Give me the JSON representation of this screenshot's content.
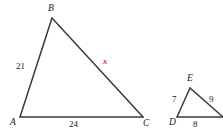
{
  "figure": {
    "type": "similar-triangles-geometry-diagram",
    "background_color": "#ffffff",
    "stroke_color": "#3a3a3a",
    "text_color": "#1a1a1a",
    "unknown_color": "#d6333f",
    "large_triangle": {
      "name": "ABC",
      "vertices": [
        {
          "key": "A",
          "label": "A",
          "x": 20,
          "y": 117
        },
        {
          "key": "B",
          "label": "B",
          "x": 52,
          "y": 18
        },
        {
          "key": "C",
          "label": "C",
          "x": 143,
          "y": 117
        }
      ],
      "sides": [
        {
          "key": "AB",
          "label": "21",
          "value": 21,
          "label_x": 16,
          "label_y": 62
        },
        {
          "key": "BC",
          "label": "x",
          "value": null,
          "is_unknown": true,
          "label_x": 103,
          "label_y": 57
        },
        {
          "key": "AC",
          "label": "24",
          "value": 24,
          "label_x": 69,
          "label_y": 120
        }
      ]
    },
    "small_triangle": {
      "name": "DEF",
      "vertices": [
        {
          "key": "D",
          "label": "D",
          "x": 177,
          "y": 117
        },
        {
          "key": "E",
          "label": "E",
          "x": 190,
          "y": 88
        },
        {
          "key": "F",
          "label": "",
          "x": 222,
          "y": 117
        }
      ],
      "sides": [
        {
          "key": "DE",
          "label": "7",
          "value": 7,
          "label_x": 172,
          "label_y": 95
        },
        {
          "key": "EF",
          "label": "9",
          "value": 9,
          "label_x": 209,
          "label_y": 95
        },
        {
          "key": "DF",
          "label": "8",
          "value": 8,
          "label_x": 193,
          "label_y": 120
        }
      ]
    },
    "vertex_labels": {
      "A": "A",
      "B": "B",
      "C": "C",
      "D": "D",
      "E": "E"
    },
    "side_lengths": {
      "AB": "21",
      "AC": "24",
      "BC": "x",
      "DE": "7",
      "EF": "9",
      "DF": "8"
    }
  }
}
